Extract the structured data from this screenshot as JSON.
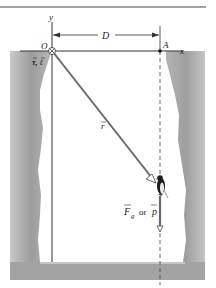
{
  "figure": {
    "origin_label": "O",
    "point_a_label": "A",
    "x_axis_label": "x",
    "y_axis_label": "y",
    "distance_label": "D",
    "torque_momentum_label": "τ, ℓ",
    "position_vector_label": "r",
    "force_label_main": "F",
    "force_label_sub": "g",
    "or_label": "or",
    "momentum_label": "p"
  },
  "colors": {
    "rock": "#a8a8a8",
    "rock_light": "#d6d6d6",
    "line": "#333333",
    "vector": "#6a6a6a",
    "background": "#ffffff"
  }
}
